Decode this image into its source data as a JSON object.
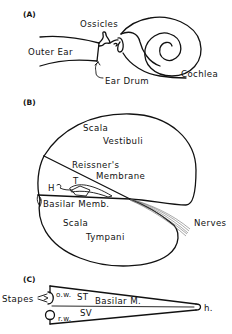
{
  "figure": {
    "panels": [
      {
        "id": "A",
        "label": "(A)",
        "labels": {
          "outer_ear": "Outer Ear",
          "ossicles": "Ossicles",
          "ear_drum": "Ear Drum",
          "cochlea": "Cochlea"
        }
      },
      {
        "id": "B",
        "label": "(B)",
        "labels": {
          "scala_vestibuli_1": "Scala",
          "scala_vestibuli_2": "Vestibuli",
          "reissners_1": "Reissner's",
          "reissners_2": "Membrane",
          "h": "H",
          "t": "T",
          "basilar": "Basilar Memb.",
          "scala_tympani_1": "Scala",
          "scala_tympani_2": "Tympani",
          "nerves": "Nerves"
        }
      },
      {
        "id": "C",
        "label": "(C)",
        "labels": {
          "stapes": "Stapes",
          "ow": "o.w.",
          "st": "ST",
          "basilar": "Basilar M.",
          "rw": "r.w.",
          "sv": "SV",
          "h": "h."
        }
      }
    ]
  }
}
